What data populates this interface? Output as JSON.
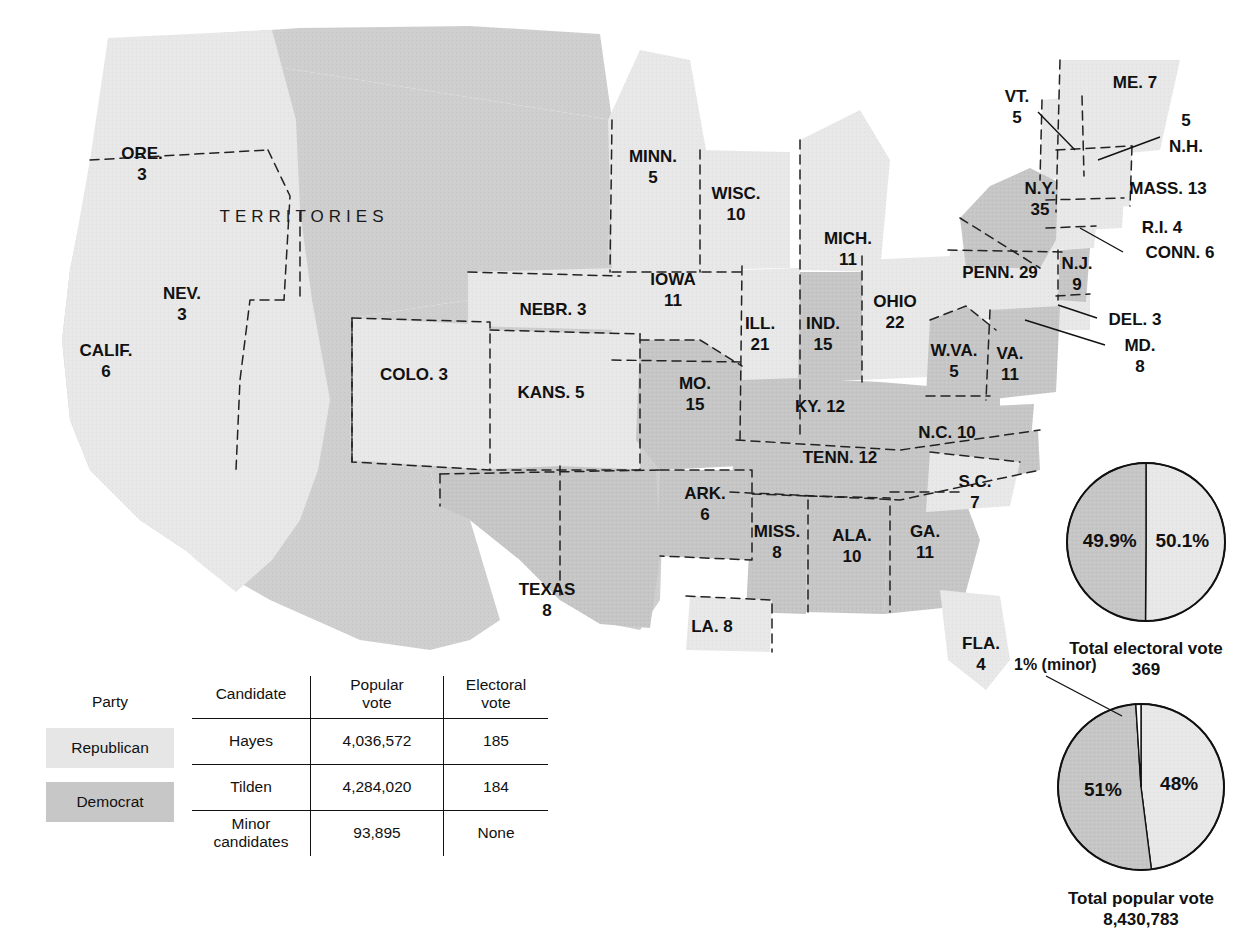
{
  "map": {
    "territories_label": "TERRITORIES",
    "states": [
      {
        "name": "ORE.",
        "votes": "3",
        "party": "republican",
        "lx": 142,
        "ly": 155,
        "stack": true
      },
      {
        "name": "NEV.",
        "votes": "3",
        "party": "republican",
        "lx": 182,
        "ly": 295,
        "stack": true
      },
      {
        "name": "CALIF.",
        "votes": "6",
        "party": "republican",
        "lx": 106,
        "ly": 352,
        "stack": true
      },
      {
        "name": "COLO.",
        "votes": "3",
        "party": "republican",
        "lx": 414,
        "ly": 376,
        "stack": false
      },
      {
        "name": "NEBR.",
        "votes": "3",
        "party": "republican",
        "lx": 553,
        "ly": 311,
        "stack": false
      },
      {
        "name": "KANS.",
        "votes": "5",
        "party": "republican",
        "lx": 551,
        "ly": 394,
        "stack": false
      },
      {
        "name": "MINN.",
        "votes": "5",
        "party": "republican",
        "lx": 653,
        "ly": 158,
        "stack": true
      },
      {
        "name": "WISC.",
        "votes": "10",
        "party": "republican",
        "lx": 736,
        "ly": 195,
        "stack": true
      },
      {
        "name": "IOWA",
        "votes": "11",
        "party": "republican",
        "lx": 673,
        "ly": 281,
        "stack": true
      },
      {
        "name": "ILL.",
        "votes": "21",
        "party": "republican",
        "lx": 760,
        "ly": 325,
        "stack": true
      },
      {
        "name": "MICH.",
        "votes": "11",
        "party": "republican",
        "lx": 848,
        "ly": 240,
        "stack": true
      },
      {
        "name": "OHIO",
        "votes": "22",
        "party": "republican",
        "lx": 895,
        "ly": 303,
        "stack": true
      },
      {
        "name": "IND.",
        "votes": "15",
        "party": "democrat",
        "lx": 823,
        "ly": 325,
        "stack": true
      },
      {
        "name": "MO.",
        "votes": "15",
        "party": "democrat",
        "lx": 695,
        "ly": 385,
        "stack": true
      },
      {
        "name": "ARK.",
        "votes": "6",
        "party": "democrat",
        "lx": 705,
        "ly": 495,
        "stack": true
      },
      {
        "name": "TEXAS",
        "votes": "8",
        "party": "democrat",
        "lx": 547,
        "ly": 591,
        "stack": true
      },
      {
        "name": "LA.",
        "votes": "8",
        "party": "republican",
        "lx": 712,
        "ly": 628,
        "stack": false
      },
      {
        "name": "MISS.",
        "votes": "8",
        "party": "democrat",
        "lx": 777,
        "ly": 533,
        "stack": true
      },
      {
        "name": "ALA.",
        "votes": "10",
        "party": "democrat",
        "lx": 852,
        "ly": 537,
        "stack": true
      },
      {
        "name": "GA.",
        "votes": "11",
        "party": "democrat",
        "lx": 925,
        "ly": 533,
        "stack": true
      },
      {
        "name": "FLA.",
        "votes": "4",
        "party": "republican",
        "lx": 981,
        "ly": 645,
        "stack": true
      },
      {
        "name": "S.C.",
        "votes": "7",
        "party": "republican",
        "lx": 975,
        "ly": 483,
        "stack": true
      },
      {
        "name": "N.C.",
        "votes": "10",
        "party": "democrat",
        "lx": 947,
        "ly": 434,
        "stack": false
      },
      {
        "name": "TENN.",
        "votes": "12",
        "party": "democrat",
        "lx": 840,
        "ly": 459,
        "stack": false
      },
      {
        "name": "KY.",
        "votes": "12",
        "party": "democrat",
        "lx": 820,
        "ly": 408,
        "stack": false
      },
      {
        "name": "W.VA.",
        "votes": "5",
        "party": "democrat",
        "lx": 954,
        "ly": 352,
        "stack": true
      },
      {
        "name": "VA.",
        "votes": "11",
        "party": "democrat",
        "lx": 1010,
        "ly": 355,
        "stack": true
      },
      {
        "name": "PENN.",
        "votes": "29",
        "party": "republican",
        "lx": 1000,
        "ly": 274,
        "stack": false
      },
      {
        "name": "N.Y.",
        "votes": "35",
        "party": "democrat",
        "lx": 1040,
        "ly": 190,
        "stack": true
      },
      {
        "name": "N.J.",
        "votes": "9",
        "party": "democrat",
        "lx": 1077,
        "ly": 265,
        "stack": true
      }
    ],
    "callouts": [
      {
        "name": "VT.",
        "votes": "5",
        "lx": 1017,
        "ly": 98,
        "stack": true,
        "line": [
          [
            1038,
            112
          ],
          [
            1075,
            150
          ]
        ]
      },
      {
        "name": "ME.",
        "votes": "7",
        "lx": 1135,
        "ly": 84,
        "stack": false,
        "line": null
      },
      {
        "name": "N.H.",
        "votes": "5",
        "lx": 1186,
        "ly": 140,
        "stack": "above",
        "line": [
          [
            1160,
            137
          ],
          [
            1098,
            160
          ]
        ]
      },
      {
        "name": "MASS.",
        "votes": "13",
        "lx": 1168,
        "ly": 190,
        "stack": false,
        "line": null
      },
      {
        "name": "R.I.",
        "votes": "4",
        "lx": 1162,
        "ly": 229,
        "stack": false,
        "line": null
      },
      {
        "name": "CONN.",
        "votes": "6",
        "lx": 1180,
        "ly": 254,
        "stack": false,
        "line": [
          [
            1123,
            252
          ],
          [
            1080,
            228
          ]
        ]
      },
      {
        "name": "DEL.",
        "votes": "3",
        "lx": 1135,
        "ly": 321,
        "stack": false,
        "line": [
          [
            1097,
            318
          ],
          [
            1058,
            305
          ]
        ]
      },
      {
        "name": "MD.",
        "votes": "8",
        "lx": 1140,
        "ly": 347,
        "stack": true,
        "line": [
          [
            1105,
            345
          ],
          [
            1025,
            320
          ]
        ]
      }
    ]
  },
  "pies": [
    {
      "id": "electoral",
      "caption_line1": "Total electoral vote",
      "caption_line2": "369",
      "slices": [
        {
          "label": "50.1%",
          "value": 50.1,
          "party": "republican"
        },
        {
          "label": "49.9%",
          "value": 49.9,
          "party": "democrat"
        }
      ]
    },
    {
      "id": "popular",
      "caption_line1": "Total popular vote",
      "caption_line2": "8,430,783",
      "minor_note": "1% (minor)",
      "slices": [
        {
          "label": "48%",
          "value": 48,
          "party": "republican"
        },
        {
          "label": "51%",
          "value": 51,
          "party": "democrat"
        },
        {
          "label": "",
          "value": 1,
          "party": "minor"
        }
      ]
    }
  ],
  "legend": {
    "party_header": "Party",
    "parties": [
      {
        "label": "Republican",
        "party": "republican"
      },
      {
        "label": "Democrat",
        "party": "democrat"
      }
    ],
    "columns": {
      "candidate": "Candidate",
      "popular_l1": "Popular",
      "popular_l2": "vote",
      "electoral_l1": "Electoral",
      "electoral_l2": "vote"
    },
    "rows": [
      {
        "candidate": "Hayes",
        "candidate2": "",
        "popular": "4,036,572",
        "electoral": "185"
      },
      {
        "candidate": "Tilden",
        "candidate2": "",
        "popular": "4,284,020",
        "electoral": "184"
      },
      {
        "candidate": "Minor",
        "candidate2": "candidates",
        "popular": "93,895",
        "electoral": "None"
      }
    ]
  },
  "colors": {
    "republican": "#e8e8e8",
    "democrat": "#c6c6c6",
    "territory": "#cfcfcf",
    "minor": "#ffffff",
    "outline": "#222222"
  }
}
